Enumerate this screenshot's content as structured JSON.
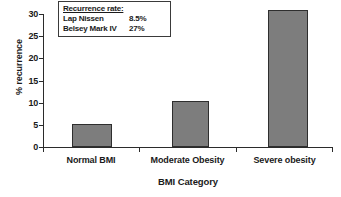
{
  "chart_data": {
    "type": "bar",
    "title": "",
    "xlabel": "BMI Category",
    "ylabel": "% recurrence",
    "categories": [
      "Normal BMI",
      "Moderate Obesity",
      "Severe obesity"
    ],
    "values": [
      5.1,
      10.3,
      30.8
    ],
    "ylim": [
      0,
      30
    ],
    "yticks": [
      0,
      5,
      10,
      15,
      20,
      25,
      30
    ],
    "ytick_labels": [
      "0",
      "5",
      "10",
      "15",
      "20",
      "25",
      "30"
    ],
    "grid": false,
    "legend": "none",
    "bar_color": "#7d7d7d",
    "bar_edge_color": "#2e2e2e",
    "axis_color": "#2b2b2b",
    "background_color": "#ffffff",
    "annotation": {
      "title": "Recurrence rate:",
      "rows": [
        {
          "name": "Lap Nissen",
          "value": "8.5%"
        },
        {
          "name": "Belsey Mark IV",
          "value": "27%"
        }
      ]
    }
  }
}
